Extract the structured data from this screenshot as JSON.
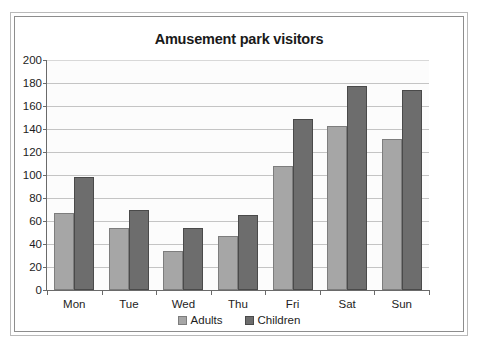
{
  "chart_data": {
    "type": "bar",
    "title": "Amusement park visitors",
    "xlabel": "",
    "ylabel": "",
    "categories": [
      "Mon",
      "Tue",
      "Wed",
      "Thu",
      "Fri",
      "Sat",
      "Sun"
    ],
    "series": [
      {
        "name": "Adults",
        "color": "#a6a6a6",
        "values": [
          67,
          54,
          34,
          47,
          108,
          143,
          131
        ]
      },
      {
        "name": "Children",
        "color": "#6d6d6d",
        "values": [
          98,
          70,
          54,
          65,
          149,
          177,
          174
        ]
      }
    ],
    "ylim": [
      0,
      200
    ],
    "ytick_step": 20,
    "yticks": [
      0,
      20,
      40,
      60,
      80,
      100,
      120,
      140,
      160,
      180,
      200
    ],
    "ytick_labels": [
      "0",
      "20",
      "40",
      "60",
      "80",
      "100",
      "120",
      "140",
      "160",
      "180",
      "200"
    ],
    "grid": true,
    "grid_axis": "y",
    "legend_position": "bottom",
    "plot_background": "#fcfcfc",
    "gridline_color": "#c4c4c4",
    "axis_color": "#6a6a6a"
  },
  "legend": {
    "items": [
      {
        "label": "Adults"
      },
      {
        "label": "Children"
      }
    ]
  }
}
